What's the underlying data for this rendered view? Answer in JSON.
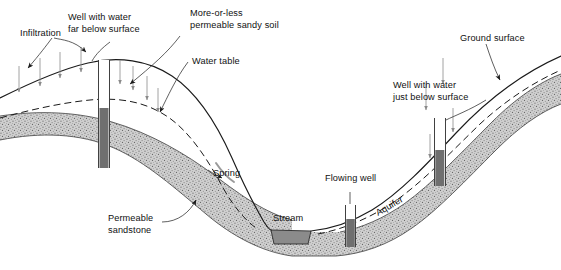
{
  "diagram": {
    "width": 561,
    "height": 270,
    "background_color": "#ffffff"
  },
  "colors": {
    "line": "#1a1a1a",
    "aquifer_fill": "#c9c9c9",
    "water_fill": "#8b8b8b",
    "stream_fill": "#8b8b8b",
    "infiltration_arrow": "#8a8a8a",
    "text": "#111111"
  },
  "labels": {
    "infiltration": "Infiltration",
    "well_far_below_l1": "Well with water",
    "well_far_below_l2": "far below surface",
    "sandy_soil_l1": "More-or-less",
    "sandy_soil_l2": "permeable sandy soil",
    "water_table": "Water table",
    "ground_surface": "Ground surface",
    "well_just_below_l1": "Well with water",
    "well_just_below_l2": "just below surface",
    "spring": "Spring",
    "flowing_well": "Flowing well",
    "stream": "Stream",
    "aquifer": "Aquifer",
    "permeable_sandstone_l1": "Permeable",
    "permeable_sandstone_l2": "sandstone"
  },
  "features": {
    "wells": [
      {
        "name": "well-water-far-below-surface",
        "water_level_description": "far below surface"
      },
      {
        "name": "flowing-well",
        "water_level_description": "artesian / flowing"
      },
      {
        "name": "well-water-just-below-surface",
        "water_level_description": "just below surface"
      }
    ],
    "layers": [
      {
        "name": "permeable-sandy-soil",
        "pattern": "blank"
      },
      {
        "name": "permeable-sandstone-aquifer",
        "pattern": "stipple"
      }
    ],
    "lines": [
      {
        "name": "ground-surface",
        "style": "solid"
      },
      {
        "name": "water-table",
        "style": "dashed"
      }
    ]
  }
}
